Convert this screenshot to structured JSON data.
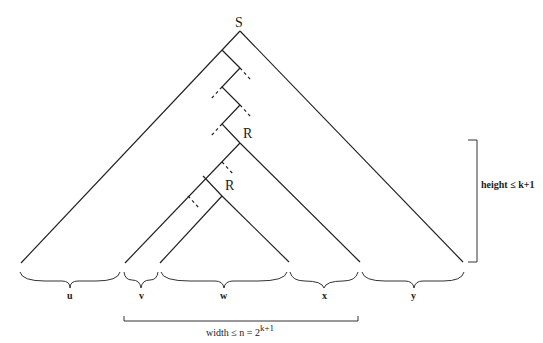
{
  "diagram": {
    "type": "parse-tree",
    "nodes": {
      "root": "S",
      "upper_repeat": "R",
      "lower_repeat": "R"
    },
    "segments": [
      "u",
      "v",
      "w",
      "x",
      "y"
    ],
    "height_annotation": "height ≤ k+1",
    "width_annotation": {
      "prefix": "width ≤ n = 2",
      "exponent": "k+1"
    }
  }
}
